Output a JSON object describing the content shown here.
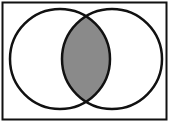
{
  "diagram": {
    "type": "venn",
    "sets": [
      "A",
      "B"
    ],
    "shaded_region": "intersection",
    "colors": {
      "background": "#ffffff",
      "outline": "#111111",
      "shade": "#8a8a8a"
    },
    "universe": {
      "x": 2,
      "y": 2,
      "width": 165,
      "height": 118
    },
    "circles": [
      {
        "name": "left",
        "cx": 60,
        "cy": 59,
        "r": 50
      },
      {
        "name": "right",
        "cx": 112,
        "cy": 59,
        "r": 50
      }
    ]
  }
}
